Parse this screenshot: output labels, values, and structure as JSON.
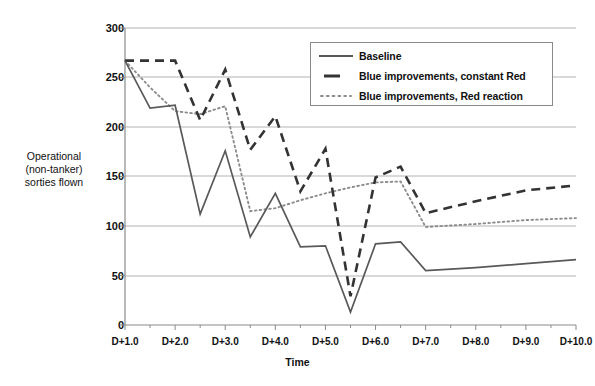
{
  "chart_data": {
    "type": "line",
    "title": "",
    "xlabel": "Time",
    "ylabel": "Operational (non-tanker) sorties flown",
    "ylabel_lines": [
      "Operational",
      "(non-tanker)",
      "sorties flown"
    ],
    "ylim": [
      0,
      300
    ],
    "yticks": [
      0,
      50,
      100,
      150,
      200,
      250,
      300
    ],
    "xlim": [
      1.0,
      10.0
    ],
    "xticks": [
      "D+1.0",
      "D+2.0",
      "D+3.0",
      "D+4.0",
      "D+5.0",
      "D+6.0",
      "D+7.0",
      "D+8.0",
      "D+9.0",
      "D+10.0"
    ],
    "grid": "horizontal",
    "legend_position": "top-right",
    "x": [
      1.0,
      1.5,
      2.0,
      2.5,
      3.0,
      3.5,
      4.0,
      4.5,
      5.0,
      5.5,
      6.0,
      6.5,
      7.0,
      8.0,
      9.0,
      10.0
    ],
    "series": [
      {
        "name": "Baseline",
        "style": "solid",
        "color": "#595959",
        "values": [
          267,
          219,
          222,
          112,
          176,
          89,
          133,
          79,
          80,
          13,
          82,
          84,
          55,
          58,
          62,
          66
        ]
      },
      {
        "name": "Blue improvements, constant Red",
        "style": "dashed",
        "color": "#333333",
        "values": [
          267,
          267,
          267,
          207,
          258,
          177,
          211,
          135,
          178,
          29,
          149,
          160,
          113,
          125,
          136,
          141
        ]
      },
      {
        "name": "Blue improvements, Red reaction",
        "style": "dotted",
        "color": "#8c8c8c",
        "values": [
          267,
          240,
          216,
          213,
          221,
          115,
          118,
          126,
          133,
          139,
          144,
          145,
          99,
          102,
          106,
          108
        ]
      }
    ]
  },
  "axis": {
    "y_tick_labels": [
      "300",
      "250",
      "200",
      "150",
      "100",
      "50",
      "0"
    ],
    "x_tick_labels": [
      "D+1.0",
      "D+2.0",
      "D+3.0",
      "D+4.0",
      "D+5.0",
      "D+6.0",
      "D+7.0",
      "D+8.0",
      "D+9.0",
      "D+10.0"
    ],
    "x_title": "Time",
    "y_title_line1": "Operational",
    "y_title_line2": "(non-tanker)",
    "y_title_line3": "sorties flown"
  },
  "legend": {
    "items": [
      {
        "label": "Baseline",
        "style": "solid"
      },
      {
        "label": "Blue improvements, constant Red",
        "style": "dashed"
      },
      {
        "label": "Blue improvements, Red reaction",
        "style": "dotted"
      }
    ]
  },
  "colors": {
    "baseline": "#595959",
    "constant_red": "#333333",
    "red_reaction": "#8c8c8c",
    "grid": "#b3b3b3",
    "axis": "#808080",
    "text": "#111111"
  }
}
